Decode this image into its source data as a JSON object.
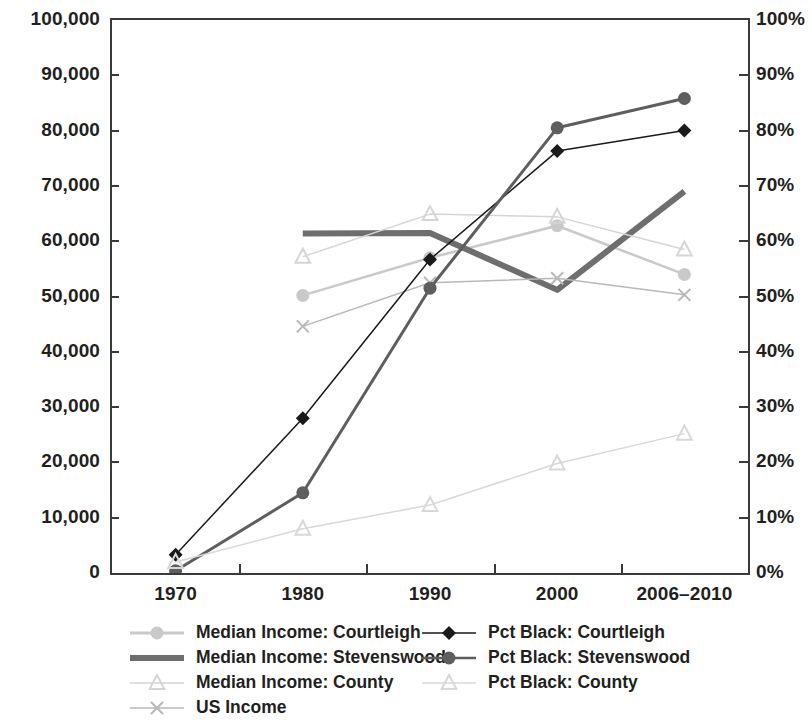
{
  "chart_data": {
    "type": "line",
    "title": "",
    "xlabel": "",
    "ylabel": "",
    "categories": [
      "1970",
      "1980",
      "1990",
      "2000",
      "2006–2010"
    ],
    "axes": {
      "left": {
        "label": "",
        "min": 0,
        "max": 100000,
        "step": 10000,
        "ticks": [
          "0",
          "10,000",
          "20,000",
          "30,000",
          "40,000",
          "50,000",
          "60,000",
          "70,000",
          "80,000",
          "90,000",
          "100,000"
        ]
      },
      "right": {
        "label": "",
        "min": 0,
        "max": 100,
        "step": 10,
        "ticks": [
          "0%",
          "10%",
          "20%",
          "30%",
          "40%",
          "50%",
          "60%",
          "70%",
          "80%",
          "90%",
          "100%"
        ]
      }
    },
    "grid": false,
    "legend_position": "bottom",
    "series": [
      {
        "name": "Median Income: Courtleigh",
        "axis": "left",
        "color": "#c9c9c9",
        "marker": "circle",
        "width": 2.5,
        "values": [
          null,
          50200,
          57000,
          62800,
          54000
        ]
      },
      {
        "name": "Median Income: Stevenswood",
        "axis": "left",
        "color": "#6e6e6e",
        "marker": "none",
        "width": 6,
        "values": [
          null,
          61400,
          61500,
          51200,
          69000
        ]
      },
      {
        "name": "Median Income: County",
        "axis": "left",
        "color": "#d5d5d5",
        "marker": "triangle",
        "width": 1.5,
        "values": [
          null,
          57200,
          64900,
          64400,
          58500
        ]
      },
      {
        "name": "US Income",
        "axis": "left",
        "color": "#b8b8b8",
        "marker": "cross",
        "width": 1.5,
        "values": [
          null,
          44600,
          52500,
          53300,
          50300
        ]
      },
      {
        "name": "Pct Black: Courtleigh",
        "axis": "right",
        "color": "#1a1a1a",
        "marker": "diamond",
        "width": 1.5,
        "values": [
          3.3,
          28.0,
          56.7,
          76.3,
          80.0
        ]
      },
      {
        "name": "Pct Black: Stevenswood",
        "axis": "right",
        "color": "#5e5e5e",
        "marker": "circle",
        "width": 3,
        "values": [
          0.4,
          14.5,
          51.5,
          80.5,
          85.8
        ]
      },
      {
        "name": "Pct Black: County",
        "axis": "right",
        "color": "#d8d8d8",
        "marker": "triangle",
        "width": 1.5,
        "values": [
          2.0,
          8.0,
          12.3,
          19.8,
          25.2
        ]
      }
    ],
    "legend": [
      {
        "label": "Median Income: Courtleigh",
        "color": "#c9c9c9",
        "marker": "circle",
        "width": 3
      },
      {
        "label": "Pct Black: Courtleigh",
        "color": "#1a1a1a",
        "marker": "diamond",
        "width": 1.5
      },
      {
        "label": "Median Income: Stevenswood",
        "color": "#6e6e6e",
        "marker": "none",
        "width": 6
      },
      {
        "label": "Pct Black: Stevenswood",
        "color": "#5e5e5e",
        "marker": "circle",
        "width": 2.5
      },
      {
        "label": "Median Income: County",
        "color": "#d5d5d5",
        "marker": "triangle",
        "width": 1.5
      },
      {
        "label": "Pct Black: County",
        "color": "#d8d8d8",
        "marker": "triangle",
        "width": 1.5
      },
      {
        "label": "US Income",
        "color": "#b8b8b8",
        "marker": "cross",
        "width": 1.5
      }
    ]
  }
}
